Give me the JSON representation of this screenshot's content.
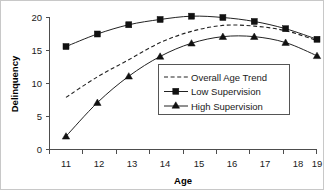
{
  "chart_data": {
    "type": "line",
    "title": "",
    "xlabel": "Age",
    "ylabel": "Delinquency",
    "categories": [
      "11",
      "12",
      "13",
      "14",
      "15",
      "16",
      "17",
      "18",
      "19"
    ],
    "x": [
      11,
      12,
      13,
      14,
      15,
      16,
      17,
      18,
      19
    ],
    "xlim": [
      11,
      19
    ],
    "ylim": [
      0,
      20
    ],
    "yticks": [
      "0",
      "5",
      "10",
      "15",
      "20"
    ],
    "ytick_values": [
      0,
      5,
      10,
      15,
      20
    ],
    "grid": false,
    "legend_position": "center-right",
    "series": [
      {
        "name": "Overall Age Trend",
        "style": "dashed",
        "marker": "none",
        "values": [
          7.9,
          11.0,
          13.6,
          16.2,
          17.9,
          18.8,
          18.7,
          18.0,
          16.5
        ]
      },
      {
        "name": "Low Supervision",
        "style": "solid",
        "marker": "square",
        "values": [
          15.6,
          17.5,
          18.9,
          19.7,
          20.2,
          20.0,
          19.4,
          18.3,
          16.7
        ]
      },
      {
        "name": "High Supervision",
        "style": "solid",
        "marker": "triangle",
        "values": [
          2.0,
          7.1,
          11.1,
          14.1,
          16.1,
          17.1,
          17.1,
          16.2,
          14.2
        ]
      }
    ]
  },
  "axes": {
    "x_title": "Age",
    "y_title": "Delinquency"
  },
  "legend": {
    "entries": [
      {
        "label": "Overall Age Trend",
        "marker": "dashed-line"
      },
      {
        "label": "Low Supervision",
        "marker": "square-marker"
      },
      {
        "label": "High Supervision",
        "marker": "triangle-marker"
      }
    ]
  },
  "colors": {
    "line": "#222222",
    "marker": "#111111",
    "axis": "#4d4d4d",
    "text": "#1a1a1a",
    "legend_border": "#555555",
    "figure_border": "#c8c8c8",
    "background": "#ffffff"
  }
}
